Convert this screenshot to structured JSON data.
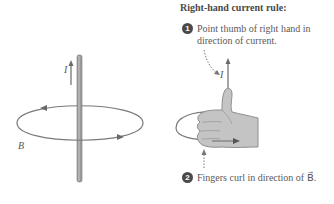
{
  "title": "Right-hand current rule:",
  "steps": [
    {
      "number": "1",
      "line1": "Point thumb of right hand in",
      "line2": "direction of current."
    },
    {
      "number": "2",
      "text": "Fingers curl in direction of B⃗."
    }
  ],
  "labels": {
    "current_left": "I",
    "field_left": "B",
    "current_right": "I"
  },
  "colors": {
    "wire": "#8a8a8a",
    "loop": "#7a7a7a",
    "hand_fill": "#c4c4c4",
    "hand_stroke": "#8e8e8e",
    "text": "#555555",
    "badge": "#4a4a4a"
  }
}
